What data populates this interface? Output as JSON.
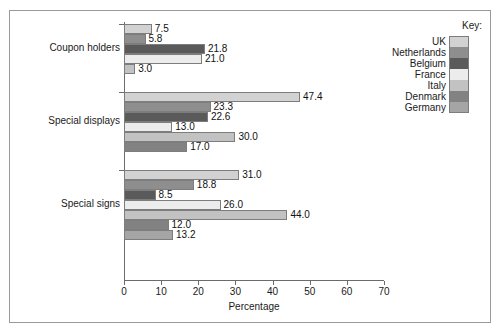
{
  "figure": {
    "top_caption": "",
    "frame_border_color": "#9a9a9a"
  },
  "chart_data": {
    "type": "bar",
    "orientation": "horizontal",
    "title": "",
    "subtitle": "",
    "xlabel": "Percentage",
    "ylabel": "",
    "xlim": [
      0,
      70
    ],
    "xticks": [
      0,
      10,
      20,
      30,
      40,
      50,
      60,
      70
    ],
    "xticklabels": [
      "0",
      "10",
      "20",
      "30",
      "40",
      "50",
      "60",
      "70"
    ],
    "grid": false,
    "legend_position": "right",
    "legend_title": "Key:",
    "categories": [
      "Coupon holders",
      "Special displays",
      "Special signs"
    ],
    "series": [
      {
        "name": "UK",
        "color": "#d2d2d2",
        "values": [
          7.5,
          47.4,
          31.0
        ]
      },
      {
        "name": "Netherlands",
        "color": "#8e8e8e",
        "values": [
          5.8,
          23.3,
          18.8
        ]
      },
      {
        "name": "Belgium",
        "color": "#5a5a5a",
        "values": [
          21.8,
          22.6,
          8.5
        ]
      },
      {
        "name": "France",
        "color": "#ececec",
        "values": [
          21.0,
          13.0,
          26.0
        ]
      },
      {
        "name": "Italy",
        "color": "#c2c2c2",
        "values": [
          3.0,
          30.0,
          44.0
        ]
      },
      {
        "name": "Denmark",
        "color": "#828282",
        "values": [
          null,
          17.0,
          12.0
        ]
      },
      {
        "name": "Germany",
        "color": "#a5a5a5",
        "values": [
          null,
          null,
          13.2
        ]
      }
    ],
    "groups": [
      {
        "category": "Coupon holders",
        "bars": [
          {
            "series": "UK",
            "value": 7.5,
            "label": "7.5",
            "color": "#d2d2d2"
          },
          {
            "series": "Netherlands",
            "value": 5.8,
            "label": "5.8",
            "color": "#8e8e8e"
          },
          {
            "series": "Belgium",
            "value": 21.8,
            "label": "21.8",
            "color": "#5a5a5a"
          },
          {
            "series": "France",
            "value": 21.0,
            "label": "21.0",
            "color": "#ececec"
          },
          {
            "series": "Italy",
            "value": 3.0,
            "label": "3.0",
            "color": "#c2c2c2"
          }
        ]
      },
      {
        "category": "Special displays",
        "bars": [
          {
            "series": "UK",
            "value": 47.4,
            "label": "47.4",
            "color": "#d2d2d2"
          },
          {
            "series": "Netherlands",
            "value": 23.3,
            "label": "23.3",
            "color": "#8e8e8e"
          },
          {
            "series": "Belgium",
            "value": 22.6,
            "label": "22.6",
            "color": "#5a5a5a"
          },
          {
            "series": "France",
            "value": 13.0,
            "label": "13.0",
            "color": "#ececec"
          },
          {
            "series": "Italy",
            "value": 30.0,
            "label": "30.0",
            "color": "#c2c2c2"
          },
          {
            "series": "Denmark",
            "value": 17.0,
            "label": "17.0",
            "color": "#828282"
          }
        ]
      },
      {
        "category": "Special signs",
        "bars": [
          {
            "series": "UK",
            "value": 31.0,
            "label": "31.0",
            "color": "#d2d2d2"
          },
          {
            "series": "Netherlands",
            "value": 18.8,
            "label": "18.8",
            "color": "#8e8e8e"
          },
          {
            "series": "Belgium",
            "value": 8.5,
            "label": "8.5",
            "color": "#5a5a5a"
          },
          {
            "series": "France",
            "value": 26.0,
            "label": "26.0",
            "color": "#ececec"
          },
          {
            "series": "Italy",
            "value": 44.0,
            "label": "44.0",
            "color": "#c2c2c2"
          },
          {
            "series": "Denmark",
            "value": 12.0,
            "label": "12.0",
            "color": "#828282"
          },
          {
            "series": "Germany",
            "value": 13.2,
            "label": "13.2",
            "color": "#a5a5a5"
          }
        ]
      }
    ]
  }
}
